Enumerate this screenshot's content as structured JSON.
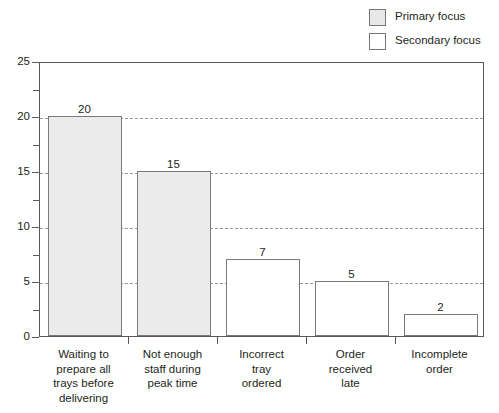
{
  "chart_data": {
    "type": "bar",
    "title": "",
    "xlabel": "",
    "ylabel": "",
    "ylim": [
      0,
      25
    ],
    "grid": "horizontal-dashed",
    "legend_position": "top-right",
    "categories": [
      "Waiting to prepare all trays before delivering",
      "Not enough staff during peak time",
      "Incorrect tray ordered",
      "Order received late",
      "Incomplete order"
    ],
    "values": [
      20,
      15,
      7,
      5,
      2
    ],
    "groups": [
      "Primary focus",
      "Primary focus",
      "Secondary focus",
      "Secondary focus",
      "Secondary focus"
    ],
    "ytick_labels": [
      "25",
      "20",
      "15",
      "10",
      "5",
      "0"
    ],
    "ytick_values": [
      25,
      20,
      15,
      10,
      5,
      0
    ],
    "yminor_values": [
      22.5,
      17.5,
      12.5,
      7.5,
      2.5
    ],
    "gridline_values": [
      20,
      15,
      10,
      5
    ],
    "value_labels": [
      "20",
      "15",
      "7",
      "5",
      "2"
    ],
    "category_label_lines": [
      [
        "Waiting to",
        "prepare all",
        "trays before",
        "delivering"
      ],
      [
        "Not enough",
        "staff during",
        "peak time"
      ],
      [
        "Incorrect",
        "tray",
        "ordered"
      ],
      [
        "Order",
        "received",
        "late"
      ],
      [
        "Incomplete",
        "order"
      ]
    ]
  },
  "legend": {
    "items": [
      {
        "label": "Primary focus",
        "swatch": "primary",
        "color": "#e8e8e8"
      },
      {
        "label": "Secondary focus",
        "swatch": "secondary",
        "color": "#ffffff"
      }
    ]
  },
  "colors": {
    "primary_fill": "#ebebeb",
    "secondary_fill": "#ffffff",
    "bar_border": "#7a7a7a",
    "axis": "#58595b",
    "gridline": "#9a9a9a",
    "text": "#231f20"
  }
}
